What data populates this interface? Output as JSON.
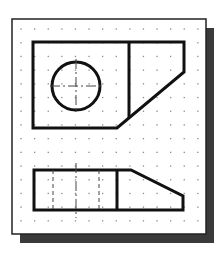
{
  "sheet": {
    "frame": {
      "x": 12,
      "y": 19,
      "width": 194,
      "height": 215
    },
    "shadow": {
      "offset_x": 8,
      "offset_y": 9,
      "color": "#3a3a3a"
    },
    "paper_color": "#ffffff",
    "border_color": "#222222",
    "grid": {
      "start_x": 21,
      "start_y": 29,
      "step_x": 13.6,
      "step_y": 13.7,
      "cols": 14,
      "rows": 15,
      "dot_color": "#8a8a8a"
    }
  },
  "views": {
    "top_view": {
      "outline": [
        [
          33,
          42
        ],
        [
          184,
          42
        ],
        [
          184,
          72
        ],
        [
          117,
          128
        ],
        [
          33,
          128
        ]
      ],
      "divider": [
        [
          129,
          42
        ],
        [
          129,
          118
        ]
      ],
      "hole": {
        "cx": 76,
        "cy": 86,
        "r": 24
      },
      "centerline_h": [
        [
          50,
          86
        ],
        [
          102,
          86
        ]
      ],
      "centerline_v": [
        [
          76,
          59
        ],
        [
          76,
          113
        ]
      ]
    },
    "front_view": {
      "outline": [
        [
          34,
          170
        ],
        [
          131,
          170
        ],
        [
          183,
          196
        ],
        [
          183,
          210
        ],
        [
          34,
          210
        ]
      ],
      "divider": [
        [
          117,
          170
        ],
        [
          117,
          210
        ]
      ],
      "hidden_lines": [
        [
          [
            53,
            170
          ],
          [
            53,
            210
          ]
        ],
        [
          [
            99,
            170
          ],
          [
            99,
            210
          ]
        ]
      ],
      "centerline_v": [
        [
          76,
          163
        ],
        [
          76,
          218
        ]
      ]
    }
  },
  "style": {
    "object_line_color": "#111111",
    "object_line_width": 3,
    "thin_line_color": "#444444",
    "thin_line_width": 1
  }
}
